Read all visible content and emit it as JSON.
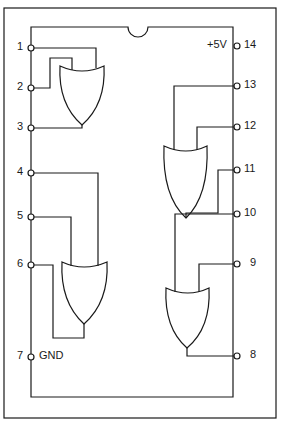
{
  "diagram": {
    "type": "IC pinout",
    "colors": {
      "line": "#1a1a1a",
      "background": "#ffffff"
    },
    "pins": {
      "p1": "1",
      "p2": "2",
      "p3": "3",
      "p4": "4",
      "p5": "5",
      "p6": "6",
      "p7": "7",
      "p8": "8",
      "p9": "9",
      "p10": "10",
      "p11": "11",
      "p12": "12",
      "p13": "13",
      "p14": "14"
    },
    "power": {
      "vcc": "+5V",
      "gnd": "GND"
    },
    "gates": [
      {
        "id": "gate-1",
        "type": "OR",
        "inputs": [
          "1",
          "2"
        ],
        "output": "3"
      },
      {
        "id": "gate-2",
        "type": "OR",
        "inputs": [
          "4",
          "5"
        ],
        "output": "6"
      },
      {
        "id": "gate-3",
        "type": "OR",
        "inputs": [
          "9",
          "10"
        ],
        "output": "8"
      },
      {
        "id": "gate-4",
        "type": "OR",
        "inputs": [
          "12",
          "13"
        ],
        "output": "11"
      }
    ]
  }
}
